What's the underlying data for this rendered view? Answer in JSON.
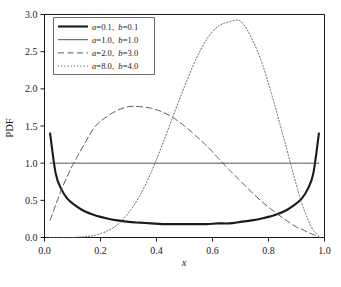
{
  "chart_data": {
    "type": "line",
    "title": "",
    "xlabel": "x",
    "ylabel": "PDF",
    "xlim": [
      0.0,
      1.0
    ],
    "ylim": [
      0.0,
      3.0
    ],
    "grid": false,
    "legend_position": "upper left",
    "xticks": [
      "0.0",
      "0.2",
      "0.4",
      "0.6",
      "0.8",
      "1.0"
    ],
    "xtick_values": [
      0.0,
      0.2,
      0.4,
      0.6,
      0.8,
      1.0
    ],
    "yticks": [
      "0.0",
      "0.5",
      "1.0",
      "1.5",
      "2.0",
      "2.5",
      "3.0"
    ],
    "ytick_values": [
      0.0,
      0.5,
      1.0,
      1.5,
      2.0,
      2.5,
      3.0
    ],
    "x": [
      0.02,
      0.04,
      0.06,
      0.08,
      0.1,
      0.14,
      0.18,
      0.22,
      0.26,
      0.3,
      0.34,
      0.38,
      0.42,
      0.46,
      0.5,
      0.54,
      0.58,
      0.62,
      0.66,
      0.7,
      0.74,
      0.78,
      0.82,
      0.86,
      0.9,
      0.92,
      0.94,
      0.96,
      0.98
    ],
    "series": [
      {
        "name": "a=0.1, b=0.1",
        "a": 0.1,
        "b": 0.1,
        "style": "solid-thick",
        "color": "#1a1a1a",
        "values": [
          1.4,
          0.86,
          0.65,
          0.53,
          0.46,
          0.36,
          0.3,
          0.26,
          0.23,
          0.21,
          0.2,
          0.19,
          0.18,
          0.18,
          0.18,
          0.18,
          0.18,
          0.19,
          0.19,
          0.21,
          0.23,
          0.26,
          0.3,
          0.36,
          0.46,
          0.53,
          0.65,
          0.86,
          1.4
        ]
      },
      {
        "name": "a=1.0, b=1.0",
        "a": 1.0,
        "b": 1.0,
        "style": "solid-thin",
        "color": "#3c3c3c",
        "values": [
          1.0,
          1.0,
          1.0,
          1.0,
          1.0,
          1.0,
          1.0,
          1.0,
          1.0,
          1.0,
          1.0,
          1.0,
          1.0,
          1.0,
          1.0,
          1.0,
          1.0,
          1.0,
          1.0,
          1.0,
          1.0,
          1.0,
          1.0,
          1.0,
          1.0,
          1.0,
          1.0,
          1.0,
          1.0
        ]
      },
      {
        "name": "a=2.0, b=3.0",
        "a": 2.0,
        "b": 3.0,
        "style": "dashed",
        "color": "#4a4a4a",
        "values": [
          0.23,
          0.44,
          0.64,
          0.81,
          0.97,
          1.24,
          1.49,
          1.62,
          1.71,
          1.76,
          1.76,
          1.74,
          1.69,
          1.61,
          1.5,
          1.37,
          1.23,
          1.07,
          0.91,
          0.76,
          0.61,
          0.47,
          0.35,
          0.24,
          0.14,
          0.11,
          0.07,
          0.04,
          0.01
        ]
      },
      {
        "name": "a=8.0, b=4.0",
        "a": 8.0,
        "b": 4.0,
        "style": "dotted",
        "color": "#565656",
        "values": [
          0.0,
          0.0,
          0.0,
          0.0,
          0.0,
          0.01,
          0.03,
          0.08,
          0.17,
          0.33,
          0.56,
          0.87,
          1.24,
          1.64,
          2.03,
          2.39,
          2.67,
          2.84,
          2.9,
          2.91,
          2.68,
          2.31,
          1.81,
          1.26,
          0.7,
          0.45,
          0.25,
          0.1,
          0.02
        ]
      }
    ]
  },
  "legend": {
    "entries": [
      {
        "a_prefix": "a",
        "a_text": "=0.1,",
        "b_prefix": "b",
        "b_text": "=0.1"
      },
      {
        "a_prefix": "a",
        "a_text": "=1.0,",
        "b_prefix": "b",
        "b_text": "=1.0"
      },
      {
        "a_prefix": "a",
        "a_text": "=2.0,",
        "b_prefix": "b",
        "b_text": "=3.0"
      },
      {
        "a_prefix": "a",
        "a_text": "=8.0,",
        "b_prefix": "b",
        "b_text": "=4.0"
      }
    ]
  },
  "colors": {
    "axis": "#1a1a1a",
    "background": "#ffffff",
    "legend_border": "#6e6e6e"
  }
}
